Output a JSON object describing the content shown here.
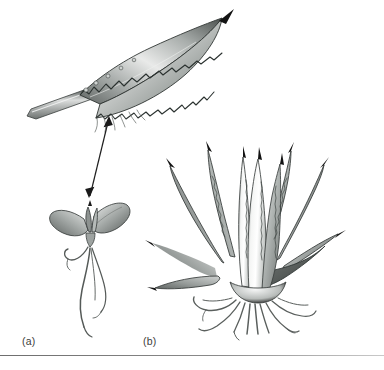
{
  "figure": {
    "background_color": "#ffffff",
    "ink_color": "#2b2b2b",
    "leaf_light": "#f2f2f2",
    "leaf_mid": "#b9bdbb",
    "leaf_dark": "#6f7472",
    "spine_color": "#111111",
    "root_color": "#6b6b6b",
    "rule_color": "#7d7d7d",
    "panels": [
      {
        "key": "a",
        "label": "(a)",
        "subject": "seedling",
        "description": "young seedling with two fleshy cotyledon leaves, central bud and long wavy fibrous roots"
      },
      {
        "key": "b",
        "label": "(b)",
        "subject": "mature-rosette",
        "description": "mature agave rosette of ten spine-tipped leaves with toothed margins and fibrous root mass"
      }
    ],
    "detail": {
      "name": "magnified-leaf",
      "description": "enlarged detached leaf with serrated spiny margin, terminal spine and tapered petiole"
    },
    "connector": {
      "name": "magnification-arrow",
      "style": "double-headed",
      "description": "double-headed arrow linking the seedling leaf to its magnified view"
    },
    "leaf_counts": {
      "rosette_leaves": 10,
      "seedling_cotyledons": 2
    },
    "footer_caption": ""
  }
}
